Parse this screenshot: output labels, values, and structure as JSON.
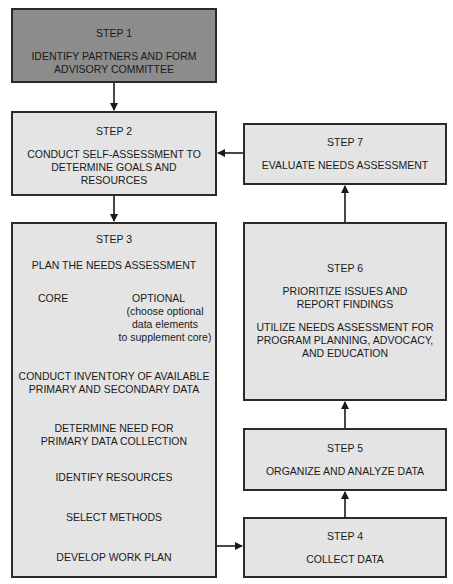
{
  "diagram": {
    "type": "flowchart",
    "steps": {
      "step1": {
        "title": "STEP 1",
        "lines": [
          "IDENTIFY PARTNERS AND FORM",
          "ADVISORY COMMITTEE"
        ]
      },
      "step2": {
        "title": "STEP 2",
        "lines": [
          "CONDUCT SELF-ASSESSMENT TO",
          "DETERMINE GOALS AND",
          "RESOURCES"
        ]
      },
      "step3": {
        "title": "STEP 3",
        "plan": "PLAN THE NEEDS ASSESSMENT",
        "core": "CORE",
        "optional": "OPTIONAL",
        "optional_note": [
          "(choose optional",
          "data elements",
          "to supplement core)"
        ],
        "inventory": [
          "CONDUCT INVENTORY OF AVAILABLE",
          "PRIMARY AND SECONDARY DATA"
        ],
        "determine": [
          "DETERMINE NEED FOR",
          "PRIMARY DATA COLLECTION"
        ],
        "resources": "IDENTIFY RESOURCES",
        "methods": "SELECT METHODS",
        "workplan": "DEVELOP WORK PLAN"
      },
      "step4": {
        "title": "STEP 4",
        "lines": [
          "COLLECT DATA"
        ]
      },
      "step5": {
        "title": "STEP 5",
        "lines": [
          "ORGANIZE AND ANALYZE DATA"
        ]
      },
      "step6": {
        "title": "STEP 6",
        "lines": [
          "PRIORITIZE ISSUES AND",
          "REPORT FINDINGS",
          "UTILIZE NEEDS ASSESSMENT FOR",
          "PROGRAM PLANNING, ADVOCACY,",
          "AND EDUCATION"
        ]
      },
      "step7": {
        "title": "STEP 7",
        "lines": [
          "EVALUATE NEEDS ASSESSMENT"
        ]
      }
    },
    "colors": {
      "step1_fill": "#8c8c8c",
      "box_fill": "#e4e4e4",
      "border": "#2a2a2a"
    }
  }
}
